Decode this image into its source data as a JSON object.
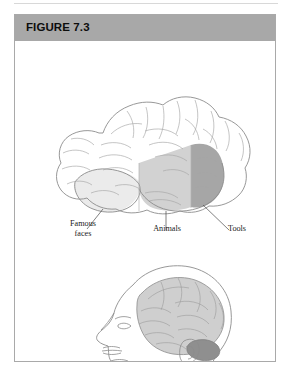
{
  "figure": {
    "title": "FIGURE 7.3",
    "header_bg": "#a8a8a8",
    "border_color": "#a9a9a9",
    "card_bg": "#ffffff"
  },
  "illustration": {
    "top_view_name": "lateral-brain-diagram",
    "bottom_view_name": "head-profile-with-brain",
    "outline_color": "#8c8c8c",
    "regions": [
      {
        "name": "famous-faces-region",
        "label": "Famous\nfaces",
        "shade": "#e6e6e6"
      },
      {
        "name": "animals-region",
        "label": "Animals",
        "shade": "#d0d0d0"
      },
      {
        "name": "tools-region",
        "label": "Tools",
        "shade": "#a6a6a6"
      }
    ]
  },
  "labels": {
    "famous_faces_line1": "Famous",
    "famous_faces_line2": "faces",
    "famous_faces": "Famous\nfaces",
    "animals": "Animals",
    "tools": "Tools"
  }
}
